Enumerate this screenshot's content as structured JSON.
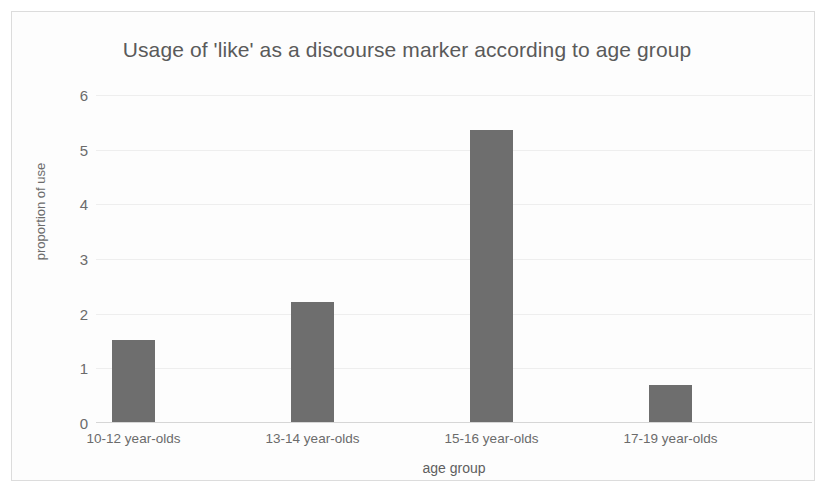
{
  "chart_data": {
    "type": "bar",
    "title": "Usage of 'like' as a discourse marker according to age group",
    "xlabel": "age group",
    "ylabel": "proportion of use",
    "categories": [
      "10-12 year-olds",
      "13-14 year-olds",
      "15-16 year-olds",
      "17-19 year-olds"
    ],
    "values": [
      1.52,
      2.21,
      5.36,
      0.69
    ],
    "ylim": [
      0,
      6
    ],
    "yticks": [
      0,
      1,
      2,
      3,
      4,
      5,
      6
    ],
    "ytick_labels": [
      "0",
      "1",
      "2",
      "3",
      "4",
      "5",
      "6"
    ],
    "grid": true,
    "legend": false,
    "legend_position": "none",
    "colors": {
      "bar": "#6e6e6e",
      "title_text": "#5a5a5a",
      "axis_text": "#6b6b6b",
      "gridline": "#eeeeee",
      "baseline": "#d6d6d6",
      "frame_border": "#dcdcdc",
      "background": "#fdfdfd"
    }
  }
}
